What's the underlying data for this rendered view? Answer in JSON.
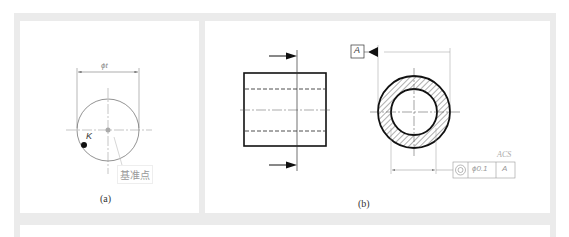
{
  "figure": {
    "panel_a": {
      "caption": "(a)",
      "dimension_label": "ϕt",
      "point_label": "K",
      "reference_label": "基准点"
    },
    "panel_b": {
      "caption": "(b)",
      "datum_label": "A",
      "tolerance_frame": {
        "symbol": "concentricity-icon",
        "value": "ϕ0.1",
        "datum": "A"
      },
      "annotation": "ACS"
    }
  },
  "colors": {
    "band": "#ebebeb",
    "line": "#111111",
    "thin_line": "#888888",
    "light_text": "#999999"
  }
}
